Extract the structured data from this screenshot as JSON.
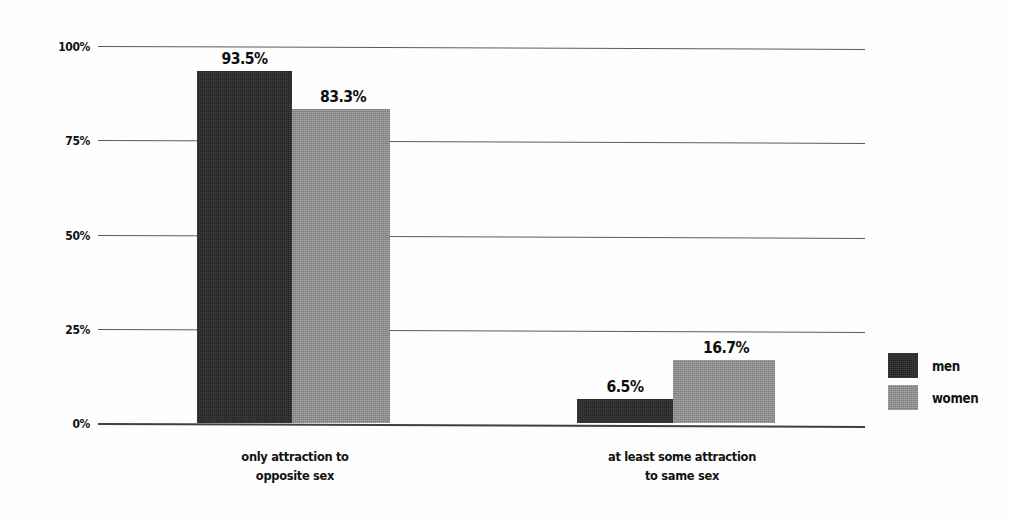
{
  "chart_data": {
    "type": "bar",
    "title": "",
    "subtitle": "",
    "xlabel": "",
    "ylabel": "",
    "ylim": [
      0,
      100
    ],
    "y_ticks": [
      "0%",
      "25%",
      "50%",
      "75%",
      "100%"
    ],
    "y_tick_values": [
      0,
      25,
      50,
      75,
      100
    ],
    "grid": true,
    "grid_axis": "y",
    "legend_position": "right",
    "categories": [
      "only attraction to opposite sex",
      "at least some attraction to same sex"
    ],
    "category_lines": [
      [
        "only attraction to",
        "opposite sex"
      ],
      [
        "at least some attraction",
        "to same sex"
      ]
    ],
    "series": [
      {
        "name": "men",
        "color": "#252525",
        "values": [
          93.5,
          6.5
        ],
        "labels": [
          "93.5%",
          "6.5%"
        ]
      },
      {
        "name": "women",
        "color": "#8b8b8b",
        "values": [
          83.3,
          16.7
        ],
        "labels": [
          "83.3%",
          "16.7%"
        ]
      }
    ]
  },
  "legend": {
    "items": [
      {
        "label": "men",
        "color": "#252525"
      },
      {
        "label": "women",
        "color": "#8b8b8b"
      }
    ]
  },
  "axis": {
    "ticks": [
      {
        "label": "100%",
        "value": 100
      },
      {
        "label": "75%",
        "value": 75
      },
      {
        "label": "50%",
        "value": 50
      },
      {
        "label": "25%",
        "value": 25
      },
      {
        "label": "0%",
        "value": 0
      }
    ]
  },
  "bars": [
    {
      "series": "men",
      "category": 0,
      "value": 93.5,
      "label": "93.5%"
    },
    {
      "series": "women",
      "category": 0,
      "value": 83.3,
      "label": "83.3%"
    },
    {
      "series": "men",
      "category": 1,
      "value": 6.5,
      "label": "6.5%"
    },
    {
      "series": "women",
      "category": 1,
      "value": 16.7,
      "label": "16.7%"
    }
  ],
  "categories": [
    {
      "line1": "only attraction to",
      "line2": "opposite sex"
    },
    {
      "line1": "at least some attraction",
      "line2": "to same sex"
    }
  ]
}
